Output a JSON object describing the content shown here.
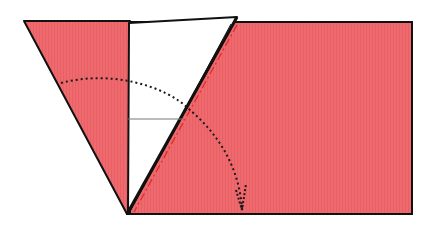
{
  "diagram": {
    "type": "origami-fold-step",
    "colors": {
      "paper_front": "#ee6a6e",
      "paper_back": "#ffffff",
      "outline": "#111111",
      "crease_valley": "#e02a2a",
      "arrow": "#1a1a1a",
      "guide_line": "#777777"
    },
    "shapes": {
      "rectangle": "130,22 412,22 412,214 130,214",
      "left_flap_red": "24,21 130,21 130,214 127,214",
      "white_flap": "128,22 237,17 127,214 128,214",
      "fold_edge": "237,17 127,214"
    },
    "guide_line": {
      "x1": 128,
      "y1": 119,
      "x2": 184,
      "y2": 119
    },
    "arrow": {
      "path": "M 61 83 C 110 70 165 85 190 110 C 225 140 240 175 242 210",
      "head": "M 236 190 L 242 210 L 246 185"
    }
  }
}
